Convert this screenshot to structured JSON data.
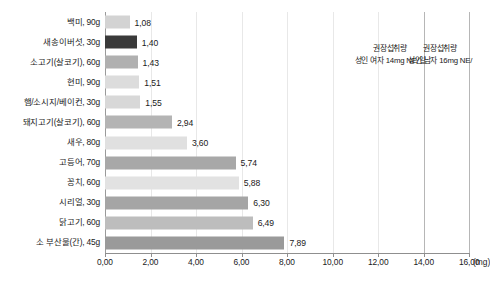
{
  "chart_data": {
    "type": "bar",
    "orientation": "horizontal",
    "title": "",
    "xlabel": "(mg)",
    "ylabel": "",
    "xlim": [
      0.0,
      16.0
    ],
    "xticks": [
      "0,00",
      "2,00",
      "4,00",
      "6,00",
      "8,00",
      "10,00",
      "12,00",
      "14,00",
      "16,00"
    ],
    "xtick_values": [
      0,
      2,
      4,
      6,
      8,
      10,
      12,
      14,
      16
    ],
    "grid": true,
    "legend": "none",
    "categories": [
      "백미, 90g",
      "새송이버섯, 30g",
      "소고기(살코기), 60g",
      "현미, 90g",
      "햄/소시지/베이컨, 30g",
      "돼지고기(살코기), 60g",
      "새우, 80g",
      "고등어, 70g",
      "꽁치, 60g",
      "시리얼, 30g",
      "닭고기, 60g",
      "소 부산물(간), 45g"
    ],
    "values": [
      1.08,
      1.4,
      1.43,
      1.51,
      1.55,
      2.94,
      3.6,
      5.74,
      5.88,
      6.3,
      6.49,
      7.89
    ],
    "value_labels": [
      "1,08",
      "1,40",
      "1,43",
      "1,51",
      "1,55",
      "2,94",
      "3,60",
      "5,74",
      "5,88",
      "6,30",
      "6,49",
      "7,89"
    ],
    "bar_colors": [
      "#d3d3d3",
      "#3a3a3a",
      "#b0b0b0",
      "#dcdcdc",
      "#d8d8d8",
      "#b4b4b4",
      "#e0e0e0",
      "#a8a8a8",
      "#e2e2e2",
      "#a5a5a5",
      "#bdbdbd",
      "#9a9a9a"
    ],
    "reference_lines": [
      {
        "value": 14,
        "line_1": "권장섭취량",
        "line_2": "성인 여자 14mg NE/일"
      },
      {
        "value": 16,
        "line_1": "권장섭취량",
        "line_2": "성인 남자 16mg NE/"
      }
    ],
    "colors": {
      "axis": "#8f8f8f",
      "grid": "#e8e8e8",
      "reference": "#b6b6b6",
      "text": "#1a1a1a",
      "background": "#ffffff"
    }
  }
}
